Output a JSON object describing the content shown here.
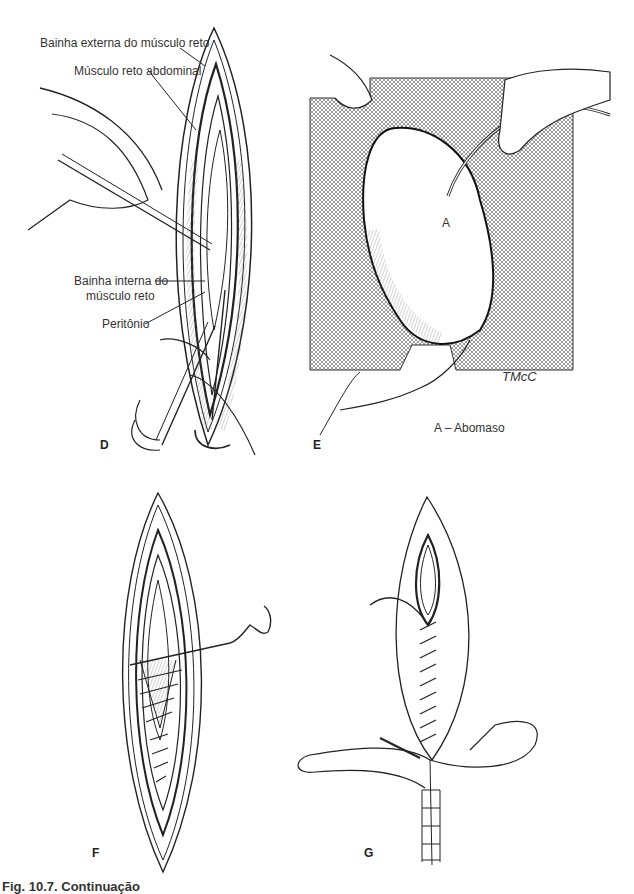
{
  "figure": {
    "caption": "Fig. 10.7. Continuação",
    "panels": {
      "D": {
        "letter": "D",
        "labels": [
          "Bainha externa do músculo reto",
          "Músculo reto abdominal",
          "Bainha interna do",
          "músculo reto",
          "Peritônio"
        ]
      },
      "E": {
        "letter": "E",
        "point_label": "A",
        "legend": "A – Abomaso",
        "signature": "TMcC"
      },
      "F": {
        "letter": "F"
      },
      "G": {
        "letter": "G"
      }
    }
  }
}
